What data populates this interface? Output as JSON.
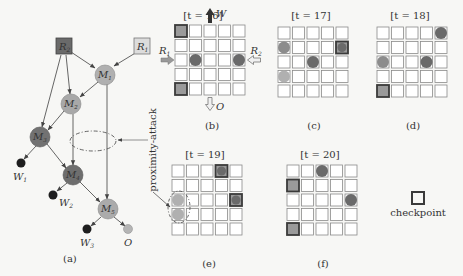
{
  "colors": {
    "background": "#f7f7f5",
    "cell_border": "#8a8a8a",
    "checkpoint_border": "#3a3a3a",
    "checkpoint_fill": "#9a9a9a",
    "dark_fill": "#6a6a6a",
    "mid_fill": "#8a8a8a",
    "light_fill": "#b0b0b0",
    "black_fill": "#1e1e1e",
    "edge": "#555555"
  },
  "panel_a": {
    "caption": "(a)",
    "nodes": [
      {
        "id": "R2",
        "label": "R",
        "sub": "2",
        "shape": "square",
        "shade": "dark"
      },
      {
        "id": "R1",
        "label": "R",
        "sub": "1",
        "shape": "square",
        "shade": "lightest"
      },
      {
        "id": "M1",
        "label": "M",
        "sub": "1",
        "shape": "circle",
        "shade": "light"
      },
      {
        "id": "M2",
        "label": "M",
        "sub": "2",
        "shape": "circle",
        "shade": "light"
      },
      {
        "id": "M3",
        "label": "M",
        "sub": "3",
        "shape": "circle",
        "shade": "dark"
      },
      {
        "id": "M4",
        "label": "M",
        "sub": "4",
        "shape": "circle",
        "shade": "dark"
      },
      {
        "id": "M5",
        "label": "M",
        "sub": "5",
        "shape": "circle",
        "shade": "light"
      },
      {
        "id": "W1",
        "label": "W",
        "sub": "1",
        "shape": "dot",
        "shade": "black"
      },
      {
        "id": "W2",
        "label": "W",
        "sub": "2",
        "shape": "dot",
        "shade": "black"
      },
      {
        "id": "W3",
        "label": "W",
        "sub": "3",
        "shape": "dot",
        "shade": "black"
      },
      {
        "id": "O",
        "label": "O",
        "sub": "",
        "shape": "dot",
        "shade": "light"
      }
    ],
    "edges": [
      [
        "R2",
        "M1"
      ],
      [
        "R1",
        "M1"
      ],
      [
        "R2",
        "M2"
      ],
      [
        "R2",
        "M3"
      ],
      [
        "M1",
        "M2"
      ],
      [
        "M2",
        "M3"
      ],
      [
        "M2",
        "M4"
      ],
      [
        "M1",
        "M5"
      ],
      [
        "M3",
        "M4"
      ],
      [
        "M4",
        "M5"
      ],
      [
        "M3",
        "W1"
      ],
      [
        "M4",
        "W2"
      ],
      [
        "M5",
        "W3"
      ],
      [
        "M5",
        "O"
      ]
    ],
    "annotation": "proximity-attack"
  },
  "grids": [
    {
      "caption": "(b)",
      "title": "[t = 16]",
      "arrows": {
        "top": "W",
        "bottom": "O",
        "left": "R1",
        "right": "R2"
      },
      "cells": [
        {
          "r": 0,
          "c": 0,
          "type": "checkpoint"
        },
        {
          "r": 4,
          "c": 0,
          "type": "checkpoint"
        },
        {
          "r": 2,
          "c": 1,
          "type": "robot",
          "shade": "dark"
        },
        {
          "r": 2,
          "c": 4,
          "type": "robot",
          "shade": "dark"
        }
      ]
    },
    {
      "caption": "(c)",
      "title": "[t = 17]",
      "cells": [
        {
          "r": 1,
          "c": 4,
          "type": "checkpoint",
          "robot": "dark"
        },
        {
          "r": 1,
          "c": 0,
          "type": "robot",
          "shade": "mid"
        },
        {
          "r": 2,
          "c": 2,
          "type": "robot",
          "shade": "dark"
        },
        {
          "r": 3,
          "c": 0,
          "type": "robot",
          "shade": "light"
        }
      ]
    },
    {
      "caption": "(d)",
      "title": "[t = 18]",
      "cells": [
        {
          "r": 0,
          "c": 4,
          "type": "robot",
          "shade": "dark"
        },
        {
          "r": 2,
          "c": 0,
          "type": "robot",
          "shade": "mid"
        },
        {
          "r": 2,
          "c": 3,
          "type": "robot",
          "shade": "dark"
        },
        {
          "r": 4,
          "c": 0,
          "type": "checkpoint"
        }
      ]
    },
    {
      "caption": "(e)",
      "title": "[t = 19]",
      "cells": [
        {
          "r": 0,
          "c": 3,
          "type": "checkpoint",
          "robot": "dark"
        },
        {
          "r": 2,
          "c": 4,
          "type": "checkpoint",
          "robot": "dark"
        },
        {
          "r": 2,
          "c": 0,
          "type": "robot",
          "shade": "light"
        },
        {
          "r": 3,
          "c": 0,
          "type": "robot",
          "shade": "light"
        }
      ],
      "highlight": "proximity-attack"
    },
    {
      "caption": "(f)",
      "title": "[t = 20]",
      "cells": [
        {
          "r": 0,
          "c": 2,
          "type": "robot",
          "shade": "dark"
        },
        {
          "r": 1,
          "c": 0,
          "type": "checkpoint"
        },
        {
          "r": 2,
          "c": 4,
          "type": "robot",
          "shade": "dark"
        },
        {
          "r": 4,
          "c": 0,
          "type": "checkpoint"
        }
      ]
    }
  ],
  "legend": {
    "checkpoint_label": "checkpoint"
  }
}
